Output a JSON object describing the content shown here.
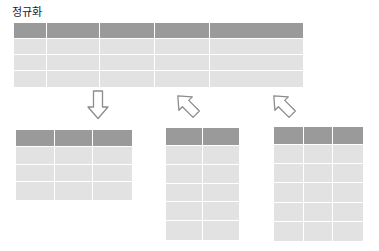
{
  "diagram": {
    "title": "정규화",
    "background_color": "#ffffff",
    "header_color": "#9a9a9a",
    "cell_color": "#e2e2e2",
    "grid_line_color": "#ffffff",
    "arrow_outline_color": "#8c8c8c"
  },
  "source_table": {
    "name": "source-table",
    "columns": 5,
    "rows": 4,
    "header_rows": 1
  },
  "result_tables": [
    {
      "name": "result-table-1",
      "columns": 3,
      "rows": 4,
      "header_rows": 1
    },
    {
      "name": "result-table-2",
      "columns": 2,
      "rows": 6,
      "header_rows": 1
    },
    {
      "name": "result-table-3",
      "columns": 3,
      "rows": 6,
      "header_rows": 1
    }
  ],
  "arrows": [
    {
      "name": "arrow-down-1",
      "direction": "down",
      "rotation_deg": 0
    },
    {
      "name": "arrow-down-2",
      "direction": "down-right",
      "rotation_deg": 135
    },
    {
      "name": "arrow-down-3",
      "direction": "down-right",
      "rotation_deg": 135
    }
  ]
}
